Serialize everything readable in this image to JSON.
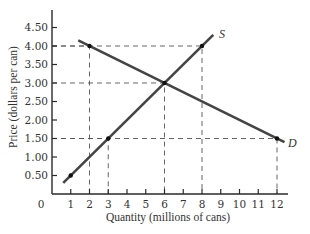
{
  "chart_data": {
    "type": "line",
    "title": "",
    "xlabel": "Quantity (millions of cans)",
    "ylabel": "Price (dollars per can)",
    "xlim": [
      0,
      12.8
    ],
    "ylim": [
      0,
      4.8
    ],
    "grid": false,
    "legend": null,
    "origin_label": "0",
    "x_ticks": [
      1,
      2,
      3,
      4,
      5,
      6,
      7,
      8,
      9,
      10,
      11,
      12
    ],
    "x_tick_labels": [
      "1",
      "2",
      "3",
      "4",
      "5",
      "6",
      "7",
      "8",
      "9",
      "10",
      "11",
      "12"
    ],
    "y_ticks": [
      0.5,
      1.0,
      1.5,
      2.0,
      2.5,
      3.0,
      3.5,
      4.0,
      4.5
    ],
    "y_tick_labels": [
      "0.50",
      "1.00",
      "1.50",
      "2.00",
      "2.50",
      "3.00",
      "3.50",
      "4.00",
      "4.50"
    ],
    "series": [
      {
        "name": "S",
        "label": "S",
        "description": "Supply",
        "x": [
          0.6,
          8.6
        ],
        "y": [
          0.3,
          4.3
        ],
        "marked_points": [
          [
            1,
            0.5
          ],
          [
            3,
            1.5
          ],
          [
            6,
            3.0
          ],
          [
            8,
            4.0
          ]
        ]
      },
      {
        "name": "D",
        "label": "D",
        "description": "Demand",
        "x": [
          1.4,
          12.4
        ],
        "y": [
          4.15,
          1.4
        ],
        "marked_points": [
          [
            2,
            4.0
          ],
          [
            6,
            3.0
          ],
          [
            12,
            1.5
          ]
        ]
      }
    ],
    "guides": [
      {
        "x": 2,
        "y": 4.0
      },
      {
        "x": 8,
        "y": 4.0
      },
      {
        "x": 6,
        "y": 3.0
      },
      {
        "x": 3,
        "y": 1.5
      },
      {
        "x": 12,
        "y": 1.5
      }
    ],
    "equilibrium": {
      "quantity": 6,
      "price": 3.0
    }
  }
}
